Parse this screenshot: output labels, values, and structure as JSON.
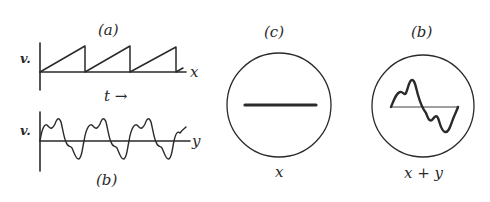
{
  "panels": {
    "a": {
      "label": "(a)",
      "ylabel": "v.",
      "axis_end_label": "x",
      "time_label": "t →",
      "waveform": "sawtooth",
      "periods": 3
    },
    "b": {
      "label": "(b)",
      "ylabel": "v.",
      "axis_end_label": "y",
      "waveform": "fundamental plus harmonic",
      "periods": 3
    },
    "c": {
      "label": "(c)",
      "screen_label": "x",
      "trace": "horizontal line"
    },
    "b_screen": {
      "label": "(b)",
      "screen_label": "x + y",
      "trace": "one cycle of waveform (b)"
    }
  },
  "colors": {
    "ink": "#2a2a2a",
    "background": "#ffffff"
  }
}
